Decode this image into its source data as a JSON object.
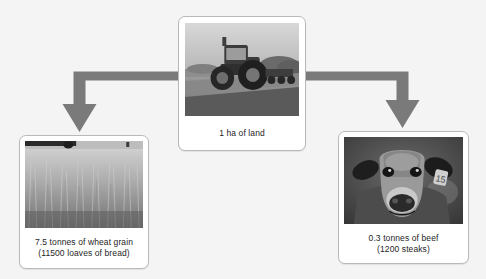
{
  "diagram": {
    "type": "flow-diagram",
    "background_color": "#f4f4f4",
    "arrow_color": "#7a7a7a",
    "card_background": "#ffffff",
    "card_border_color": "#b9b9b9",
    "text_color": "#1e1e1e"
  },
  "source": {
    "id": "land",
    "image_name": "tractor-in-field-photo",
    "caption": "1 ha of land"
  },
  "outputs": [
    {
      "id": "wheat",
      "image_name": "wheat-field-photo",
      "caption_line1": "7.5 tonnes of wheat grain",
      "caption_line2": "(11500 loaves of bread)",
      "amount": "7.5",
      "unit": "tonnes",
      "product": "wheat grain",
      "equivalent_count": "11500",
      "equivalent_item": "loaves of bread"
    },
    {
      "id": "beef",
      "image_name": "cow-head-photo",
      "caption_line1": "0.3 tonnes of beef",
      "caption_line2": "(1200 steaks)",
      "amount": "0.3",
      "unit": "tonnes",
      "product": "beef",
      "equivalent_count": "1200",
      "equivalent_item": "steaks"
    }
  ],
  "arrows": [
    {
      "id": "arrow-to-wheat",
      "name": "elbow-arrow-left",
      "direction": "down-left"
    },
    {
      "id": "arrow-to-beef",
      "name": "elbow-arrow-right",
      "direction": "down-right"
    }
  ]
}
